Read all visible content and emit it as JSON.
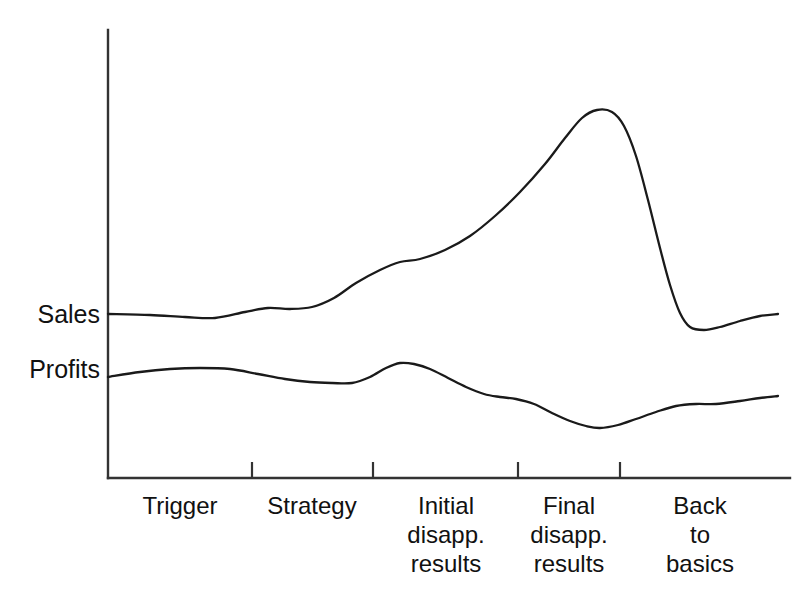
{
  "chart_data": {
    "type": "line",
    "title": "",
    "subtitle": "",
    "xlabel": "",
    "ylabel": "",
    "grid": false,
    "legend_position": "left-axis-inline",
    "axis": {
      "x_range_px": [
        108,
        790
      ],
      "y_range_px": [
        30,
        478
      ],
      "tick_positions_px": [
        252,
        373,
        518,
        620
      ],
      "x_axis_y_px": 478,
      "y_axis_x_px": 108
    },
    "categories": [
      "Trigger",
      "Strategy",
      "Initial disapp. results",
      "Final disapp. results",
      "Back to basics"
    ],
    "category_labels": [
      {
        "lines": [
          "Trigger"
        ],
        "center_x": 180
      },
      {
        "lines": [
          "Strategy"
        ],
        "center_x": 312
      },
      {
        "lines": [
          "Initial",
          "disapp.",
          "results"
        ],
        "center_x": 446
      },
      {
        "lines": [
          "Final",
          "disapp.",
          "results"
        ],
        "center_x": 569
      },
      {
        "lines": [
          "Back",
          "to",
          "basics"
        ],
        "center_x": 700
      }
    ],
    "series": [
      {
        "name": "Sales",
        "color": "#1a1a1a",
        "baseline_px": 314,
        "peak_px": {
          "x": 597,
          "y": 110
        },
        "trough_after_peak_px": {
          "x": 690,
          "y": 327
        },
        "end_px": {
          "x": 778,
          "y": 314
        },
        "points": [
          [
            108,
            314
          ],
          [
            150,
            315
          ],
          [
            185,
            317
          ],
          [
            215,
            318
          ],
          [
            245,
            312
          ],
          [
            268,
            308
          ],
          [
            290,
            309
          ],
          [
            312,
            307
          ],
          [
            334,
            298
          ],
          [
            356,
            283
          ],
          [
            380,
            270
          ],
          [
            400,
            262
          ],
          [
            420,
            259
          ],
          [
            445,
            250
          ],
          [
            470,
            236
          ],
          [
            495,
            216
          ],
          [
            520,
            192
          ],
          [
            545,
            164
          ],
          [
            565,
            138
          ],
          [
            582,
            118
          ],
          [
            597,
            110
          ],
          [
            612,
            112
          ],
          [
            624,
            126
          ],
          [
            636,
            156
          ],
          [
            648,
            200
          ],
          [
            660,
            248
          ],
          [
            670,
            285
          ],
          [
            680,
            313
          ],
          [
            690,
            327
          ],
          [
            704,
            330
          ],
          [
            720,
            327
          ],
          [
            740,
            321
          ],
          [
            760,
            316
          ],
          [
            778,
            314
          ]
        ]
      },
      {
        "name": "Profits",
        "color": "#1a1a1a",
        "baseline_px": 377,
        "local_peak_px": {
          "x": 400,
          "y": 363
        },
        "trough_px": {
          "x": 600,
          "y": 428
        },
        "end_px": {
          "x": 778,
          "y": 396
        },
        "points": [
          [
            108,
            377
          ],
          [
            140,
            372
          ],
          [
            170,
            369
          ],
          [
            200,
            368
          ],
          [
            230,
            369
          ],
          [
            258,
            374
          ],
          [
            285,
            379
          ],
          [
            310,
            382
          ],
          [
            332,
            383
          ],
          [
            352,
            383
          ],
          [
            370,
            377
          ],
          [
            386,
            368
          ],
          [
            400,
            363
          ],
          [
            414,
            364
          ],
          [
            430,
            369
          ],
          [
            448,
            378
          ],
          [
            466,
            387
          ],
          [
            484,
            394
          ],
          [
            500,
            397
          ],
          [
            516,
            399
          ],
          [
            534,
            404
          ],
          [
            552,
            413
          ],
          [
            570,
            421
          ],
          [
            586,
            426
          ],
          [
            600,
            428
          ],
          [
            618,
            425
          ],
          [
            636,
            419
          ],
          [
            656,
            412
          ],
          [
            676,
            406
          ],
          [
            696,
            404
          ],
          [
            716,
            404
          ],
          [
            740,
            401
          ],
          [
            760,
            398
          ],
          [
            778,
            396
          ]
        ]
      }
    ]
  },
  "labels": {
    "sales": "Sales",
    "profits": "Profits"
  }
}
